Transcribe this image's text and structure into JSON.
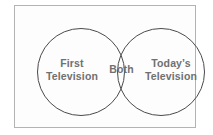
{
  "diagram": {
    "type": "venn-two-set",
    "title": "",
    "frame": {
      "border_color": "#b3b3b3",
      "background_color": "#fdfdfd"
    },
    "circle_color": "#4a4a4a",
    "label_color": "#707070",
    "sets": [
      {
        "id": "left",
        "label_line1": "First",
        "label_line2": "Television"
      },
      {
        "id": "right",
        "label_line1": "Today’s",
        "label_line2": "Television"
      }
    ],
    "intersection": {
      "id": "both",
      "label": "Both"
    }
  }
}
